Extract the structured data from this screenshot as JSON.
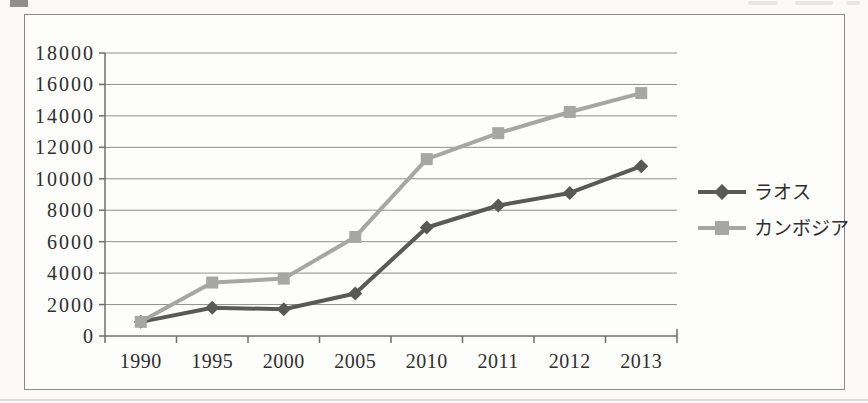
{
  "chart_data": {
    "type": "line",
    "title": "",
    "xlabel": "",
    "ylabel": "",
    "categories": [
      "1990",
      "1995",
      "2000",
      "2005",
      "2010",
      "2011",
      "2012",
      "2013"
    ],
    "series": [
      {
        "name": "ラオス",
        "marker": "diamond",
        "color": "#595959",
        "values": [
          900,
          1800,
          1700,
          2700,
          6900,
          8300,
          9100,
          10800
        ]
      },
      {
        "name": "カンボジア",
        "marker": "square",
        "color": "#a6a6a6",
        "values": [
          900,
          3400,
          3650,
          6300,
          11250,
          12900,
          14250,
          15450
        ]
      }
    ],
    "ylim": [
      0,
      18000
    ],
    "ytick_interval": 2000,
    "y_tick_labels": [
      "0",
      "2000",
      "4000",
      "6000",
      "8000",
      "10000",
      "12000",
      "14000",
      "16000",
      "18000"
    ],
    "grid": true,
    "legend_position": "right-middle",
    "colors": {
      "gridline": "#8f8f8f",
      "axis": "#6e6e6e",
      "text": "#2e2e2e",
      "frame_border": "#8a8a8a",
      "series_laos": "#595959",
      "series_cambodia": "#a6a6a6"
    }
  }
}
